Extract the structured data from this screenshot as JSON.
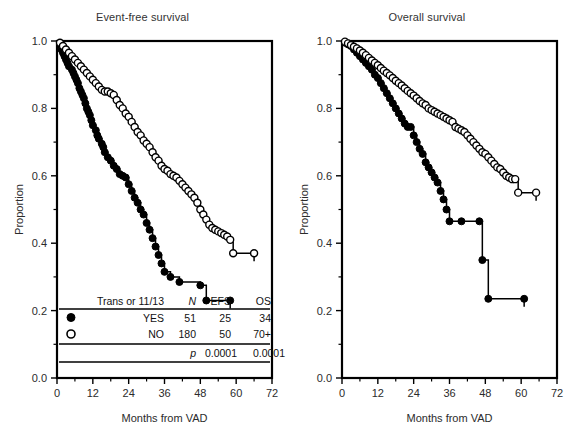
{
  "figure": {
    "background": "#ffffff",
    "axis_color": "#000000",
    "text_color": "#2b2b2b"
  },
  "panels": [
    {
      "id": "efs",
      "title": "Event-free survival",
      "xlabel": "Months from VAD",
      "ylabel": "Proportion"
    },
    {
      "id": "os",
      "title": "Overall survival",
      "xlabel": "Months from VAD",
      "ylabel": "Proportion"
    }
  ],
  "axis": {
    "x_ticks": [
      "0",
      "12",
      "24",
      "36",
      "48",
      "60",
      "72"
    ],
    "y_ticks": [
      "0.0",
      "0.2",
      "0.4",
      "0.6",
      "0.8",
      "1.0"
    ]
  },
  "legend_table": {
    "header": {
      "group": "Trans or 11/13",
      "n": "N",
      "efs": "EFS",
      "os": "OS"
    },
    "rows": [
      {
        "marker": "filled-circle",
        "group": "YES",
        "n": "51",
        "efs": "25",
        "os": "34"
      },
      {
        "marker": "open-circle",
        "group": "NO",
        "n": "180",
        "efs": "50",
        "os": "70+"
      }
    ],
    "pvalue_row": {
      "label": "p",
      "efs": "0.0001",
      "os": "0.0001"
    }
  },
  "chart_data": {
    "type": "line",
    "xlabel": "Months from VAD",
    "ylabel": "Proportion",
    "xlim": [
      0,
      72
    ],
    "ylim": [
      0.0,
      1.0
    ],
    "grid": false,
    "legend_position": "inset-bottom-left",
    "panels": [
      {
        "name": "Event-free survival",
        "series": [
          {
            "name": "Trans or 11/13 YES",
            "marker": "filled-circle",
            "n": 51,
            "points": [
              [
                0,
                1.0
              ],
              [
                1,
                0.99
              ],
              [
                1.5,
                0.975
              ],
              [
                2,
                0.965
              ],
              [
                2.5,
                0.955
              ],
              [
                3,
                0.945
              ],
              [
                3.5,
                0.935
              ],
              [
                4,
                0.925
              ],
              [
                5,
                0.915
              ],
              [
                5.5,
                0.905
              ],
              [
                6,
                0.895
              ],
              [
                6.5,
                0.885
              ],
              [
                7,
                0.875
              ],
              [
                7.5,
                0.86
              ],
              [
                8,
                0.85
              ],
              [
                8.5,
                0.84
              ],
              [
                9,
                0.83
              ],
              [
                9.5,
                0.815
              ],
              [
                10,
                0.8
              ],
              [
                10.5,
                0.79
              ],
              [
                11,
                0.78
              ],
              [
                11.5,
                0.765
              ],
              [
                12,
                0.75
              ],
              [
                13,
                0.735
              ],
              [
                13.5,
                0.72
              ],
              [
                14,
                0.71
              ],
              [
                15,
                0.695
              ],
              [
                15.5,
                0.685
              ],
              [
                16,
                0.67
              ],
              [
                17,
                0.655
              ],
              [
                18,
                0.645
              ],
              [
                19,
                0.63
              ],
              [
                20,
                0.62
              ],
              [
                21,
                0.605
              ],
              [
                22,
                0.6
              ],
              [
                23,
                0.595
              ],
              [
                24,
                0.575
              ],
              [
                25,
                0.555
              ],
              [
                26,
                0.535
              ],
              [
                27,
                0.52
              ],
              [
                28,
                0.5
              ],
              [
                29,
                0.485
              ],
              [
                30,
                0.46
              ],
              [
                31,
                0.44
              ],
              [
                32,
                0.415
              ],
              [
                33,
                0.39
              ],
              [
                34,
                0.365
              ],
              [
                35,
                0.34
              ],
              [
                36,
                0.315
              ],
              [
                38,
                0.3
              ],
              [
                41,
                0.285
              ],
              [
                48,
                0.275
              ],
              [
                50,
                0.23
              ],
              [
                58,
                0.23
              ]
            ],
            "final_value": 0.23,
            "censor_end": 58
          },
          {
            "name": "Trans or 11/13 NO",
            "marker": "open-circle",
            "n": 180,
            "points": [
              [
                0,
                1.0
              ],
              [
                1,
                0.995
              ],
              [
                2,
                0.985
              ],
              [
                3,
                0.975
              ],
              [
                4,
                0.965
              ],
              [
                5,
                0.955
              ],
              [
                6,
                0.945
              ],
              [
                7,
                0.935
              ],
              [
                8,
                0.925
              ],
              [
                9,
                0.915
              ],
              [
                10,
                0.905
              ],
              [
                11,
                0.895
              ],
              [
                12,
                0.885
              ],
              [
                13,
                0.875
              ],
              [
                14,
                0.865
              ],
              [
                15,
                0.855
              ],
              [
                16,
                0.85
              ],
              [
                17,
                0.85
              ],
              [
                18,
                0.845
              ],
              [
                19,
                0.84
              ],
              [
                20,
                0.825
              ],
              [
                21,
                0.81
              ],
              [
                22,
                0.8
              ],
              [
                23,
                0.785
              ],
              [
                24,
                0.775
              ],
              [
                25,
                0.76
              ],
              [
                26,
                0.745
              ],
              [
                27,
                0.73
              ],
              [
                28,
                0.72
              ],
              [
                29,
                0.705
              ],
              [
                30,
                0.695
              ],
              [
                31,
                0.685
              ],
              [
                32,
                0.67
              ],
              [
                33,
                0.655
              ],
              [
                34,
                0.645
              ],
              [
                35,
                0.63
              ],
              [
                36,
                0.62
              ],
              [
                37,
                0.615
              ],
              [
                38,
                0.605
              ],
              [
                39,
                0.6
              ],
              [
                40,
                0.595
              ],
              [
                41,
                0.585
              ],
              [
                42,
                0.575
              ],
              [
                43,
                0.565
              ],
              [
                44,
                0.555
              ],
              [
                45,
                0.545
              ],
              [
                46,
                0.535
              ],
              [
                47,
                0.52
              ],
              [
                48,
                0.5
              ],
              [
                49,
                0.485
              ],
              [
                50,
                0.47
              ],
              [
                51,
                0.455
              ],
              [
                52,
                0.445
              ],
              [
                53,
                0.44
              ],
              [
                54,
                0.435
              ],
              [
                55,
                0.43
              ],
              [
                56,
                0.425
              ],
              [
                57,
                0.42
              ],
              [
                58,
                0.41
              ],
              [
                59,
                0.37
              ],
              [
                66,
                0.37
              ]
            ],
            "final_value": 0.37,
            "censor_end": 66
          }
        ]
      },
      {
        "name": "Overall survival",
        "series": [
          {
            "name": "Trans or 11/13 YES",
            "marker": "filled-circle",
            "n": 51,
            "points": [
              [
                0,
                1.0
              ],
              [
                1,
                0.995
              ],
              [
                2,
                0.99
              ],
              [
                3,
                0.985
              ],
              [
                4,
                0.975
              ],
              [
                5,
                0.965
              ],
              [
                6,
                0.955
              ],
              [
                7,
                0.945
              ],
              [
                8,
                0.935
              ],
              [
                9,
                0.925
              ],
              [
                10,
                0.915
              ],
              [
                11,
                0.9
              ],
              [
                12,
                0.89
              ],
              [
                13,
                0.875
              ],
              [
                14,
                0.86
              ],
              [
                15,
                0.845
              ],
              [
                16,
                0.83
              ],
              [
                17,
                0.815
              ],
              [
                18,
                0.8
              ],
              [
                19,
                0.785
              ],
              [
                20,
                0.77
              ],
              [
                21,
                0.755
              ],
              [
                22,
                0.745
              ],
              [
                23,
                0.745
              ],
              [
                24,
                0.72
              ],
              [
                25,
                0.7
              ],
              [
                26,
                0.68
              ],
              [
                27,
                0.665
              ],
              [
                28,
                0.64
              ],
              [
                29,
                0.625
              ],
              [
                30,
                0.61
              ],
              [
                31,
                0.595
              ],
              [
                32,
                0.58
              ],
              [
                33,
                0.555
              ],
              [
                34,
                0.53
              ],
              [
                35,
                0.5
              ],
              [
                36,
                0.465
              ],
              [
                40,
                0.465
              ],
              [
                46,
                0.465
              ],
              [
                47,
                0.35
              ],
              [
                49,
                0.235
              ],
              [
                61,
                0.235
              ]
            ],
            "final_value": 0.235,
            "censor_end": 61
          },
          {
            "name": "Trans or 11/13 NO",
            "marker": "open-circle",
            "n": 180,
            "points": [
              [
                0,
                1.0
              ],
              [
                1,
                0.998
              ],
              [
                2,
                0.993
              ],
              [
                3,
                0.988
              ],
              [
                4,
                0.983
              ],
              [
                5,
                0.978
              ],
              [
                6,
                0.972
              ],
              [
                7,
                0.965
              ],
              [
                8,
                0.958
              ],
              [
                9,
                0.95
              ],
              [
                10,
                0.942
              ],
              [
                11,
                0.935
              ],
              [
                12,
                0.928
              ],
              [
                13,
                0.92
              ],
              [
                14,
                0.912
              ],
              [
                15,
                0.905
              ],
              [
                16,
                0.898
              ],
              [
                17,
                0.89
              ],
              [
                18,
                0.882
              ],
              [
                19,
                0.875
              ],
              [
                20,
                0.868
              ],
              [
                21,
                0.86
              ],
              [
                22,
                0.852
              ],
              [
                23,
                0.845
              ],
              [
                24,
                0.838
              ],
              [
                25,
                0.83
              ],
              [
                26,
                0.822
              ],
              [
                27,
                0.815
              ],
              [
                28,
                0.81
              ],
              [
                29,
                0.8
              ],
              [
                30,
                0.795
              ],
              [
                31,
                0.79
              ],
              [
                32,
                0.785
              ],
              [
                33,
                0.78
              ],
              [
                34,
                0.775
              ],
              [
                35,
                0.77
              ],
              [
                36,
                0.765
              ],
              [
                37,
                0.76
              ],
              [
                38,
                0.745
              ],
              [
                39,
                0.74
              ],
              [
                40,
                0.735
              ],
              [
                41,
                0.73
              ],
              [
                42,
                0.72
              ],
              [
                43,
                0.71
              ],
              [
                44,
                0.7
              ],
              [
                45,
                0.69
              ],
              [
                46,
                0.68
              ],
              [
                47,
                0.67
              ],
              [
                48,
                0.665
              ],
              [
                49,
                0.655
              ],
              [
                50,
                0.645
              ],
              [
                51,
                0.635
              ],
              [
                52,
                0.625
              ],
              [
                53,
                0.62
              ],
              [
                54,
                0.61
              ],
              [
                55,
                0.6
              ],
              [
                56,
                0.595
              ],
              [
                57,
                0.59
              ],
              [
                58,
                0.59
              ],
              [
                59,
                0.55
              ],
              [
                65,
                0.55
              ]
            ],
            "final_value": 0.55,
            "censor_end": 65
          }
        ]
      }
    ]
  }
}
